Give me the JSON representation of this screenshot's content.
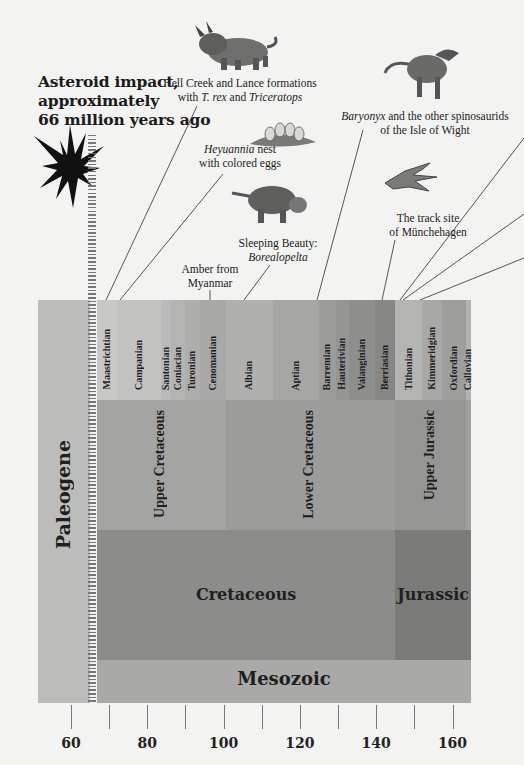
{
  "headline": {
    "line1": "Asteroid impact,",
    "line2": "approximately",
    "line3": "66 million years ago"
  },
  "annotations": {
    "hell_creek": {
      "line1": "Hell Creek and Lance formations",
      "line2_pre": "with ",
      "line2_italic1": "T. rex",
      "line2_mid": " and ",
      "line2_italic2": "Triceratops"
    },
    "heyuannia": {
      "italic": "Heyuannia",
      "line1_post": " nest",
      "line2": "with colored eggs"
    },
    "sleeping_beauty": {
      "line1": "Sleeping Beauty:",
      "line2_italic": "Borealopelta"
    },
    "amber": {
      "line1": "Amber from",
      "line2": "Myanmar"
    },
    "baryonyx": {
      "italic": "Baryonyx",
      "line1_post": " and the other spinosaurids",
      "line2": "of the Isle of Wight"
    },
    "track_site": {
      "line1": "The track site",
      "line2": "of Münchehagen"
    }
  },
  "illustrations": [
    "triceratops",
    "heyuannia-nest",
    "borealopelta",
    "baryonyx",
    "dinosaur-footprint",
    "asteroid-starburst"
  ],
  "colors": {
    "background": "#f3f3f1",
    "paleogene": "#bcbcba",
    "era": "#a9a9a7",
    "cretaceous_period": "#8c8c8a",
    "jurassic_period": "#7b7b79",
    "epoch": "#a3a3a1",
    "text": "#1f1f1f"
  },
  "chart_data": {
    "type": "timeline",
    "title": "Asteroid impact, approximately 66 million years ago",
    "xlabel": "Millions of years ago",
    "xlim": [
      57,
      166
    ],
    "ticks": [
      60,
      70,
      80,
      90,
      100,
      110,
      120,
      130,
      140,
      150,
      160
    ],
    "tick_labels": [
      "60",
      "80",
      "100",
      "120",
      "140",
      "160"
    ],
    "paleogene": {
      "label": "Paleogene",
      "start": 57,
      "end": 66
    },
    "era": {
      "label": "Mesozoic",
      "start": 66,
      "end": 166
    },
    "periods": [
      {
        "label": "Cretaceous",
        "start": 66,
        "end": 145
      },
      {
        "label": "Jurassic",
        "start": 145,
        "end": 166
      }
    ],
    "epochs": [
      {
        "label": "Upper Cretaceous",
        "start": 66,
        "end": 100.5
      },
      {
        "label": "Lower Cretaceous",
        "start": 100.5,
        "end": 145
      },
      {
        "label": "Upper Jurassic",
        "start": 145,
        "end": 163.5
      },
      {
        "label": "",
        "start": 163.5,
        "end": 166
      }
    ],
    "stages": [
      {
        "label": "Maastrichtian",
        "start": 66,
        "end": 72.1,
        "color": "#c8c8c6"
      },
      {
        "label": "Campanian",
        "start": 72.1,
        "end": 83.6,
        "color": "#c2c2c0"
      },
      {
        "label": "Santonian",
        "start": 83.6,
        "end": 86.3,
        "color": "#bababa"
      },
      {
        "label": "Coniacian",
        "start": 86.3,
        "end": 89.8,
        "color": "#b4b4b2"
      },
      {
        "label": "Turonian",
        "start": 89.8,
        "end": 93.9,
        "color": "#aeaeac"
      },
      {
        "label": "Cenomanian",
        "start": 93.9,
        "end": 100.5,
        "color": "#a8a8a6"
      },
      {
        "label": "Albian",
        "start": 100.5,
        "end": 113,
        "color": "#b0b0ae"
      },
      {
        "label": "Aptian",
        "start": 113,
        "end": 125,
        "color": "#a6a6a4"
      },
      {
        "label": "Barremian",
        "start": 125,
        "end": 129.4,
        "color": "#9c9c9a"
      },
      {
        "label": "Hauterivian",
        "start": 129.4,
        "end": 132.9,
        "color": "#959593"
      },
      {
        "label": "Valanginian",
        "start": 132.9,
        "end": 139.8,
        "color": "#8e8e8c"
      },
      {
        "label": "Berriasian",
        "start": 139.8,
        "end": 145,
        "color": "#878785"
      },
      {
        "label": "Tithonian",
        "start": 145,
        "end": 152.1,
        "color": "#b4b4b2"
      },
      {
        "label": "Kimmeridgian",
        "start": 152.1,
        "end": 157.3,
        "color": "#a8a8a6"
      },
      {
        "label": "Oxfordian",
        "start": 157.3,
        "end": 163.5,
        "color": "#9e9e9c"
      },
      {
        "label": "Callovian",
        "start": 163.5,
        "end": 166,
        "color": "#b2b2b0"
      }
    ],
    "events": [
      {
        "label": "Asteroid impact",
        "age": 66
      },
      {
        "label": "Hell Creek and Lance formations with T. rex and Triceratops",
        "age": 67
      },
      {
        "label": "Heyuannia nest with colored eggs",
        "age": 70
      },
      {
        "label": "Amber from Myanmar",
        "age": 99
      },
      {
        "label": "Sleeping Beauty: Borealopelta",
        "age": 110
      },
      {
        "label": "Baryonyx and the other spinosaurids of the Isle of Wight",
        "age": 125
      },
      {
        "label": "The track site of Münchehagen",
        "age": 140
      },
      {
        "label": "(off-image annotation)",
        "age": 147
      },
      {
        "label": "(off-image annotation)",
        "age": 148
      },
      {
        "label": "(off-image annotation)",
        "age": 151
      }
    ]
  }
}
